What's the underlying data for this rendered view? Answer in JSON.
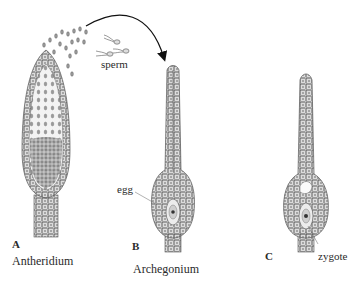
{
  "figure": {
    "panels": [
      {
        "letter": "A",
        "name": "Antheridium"
      },
      {
        "letter": "B",
        "name": "Archegonium"
      },
      {
        "letter": "C",
        "name": ""
      }
    ],
    "annotations": {
      "sperm": "sperm",
      "egg": "egg",
      "zygote": "zygote"
    },
    "colors": {
      "cell_fill": "#d8d8d8",
      "cell_stroke": "#555555",
      "nucleus": "#444444",
      "arrow": "#111111",
      "background": "#ffffff"
    }
  }
}
